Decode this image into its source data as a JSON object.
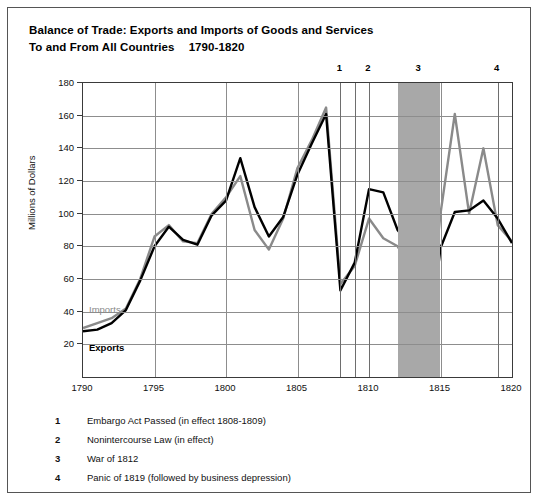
{
  "title": {
    "line1": "Balance of Trade: Exports and Imports of Goods and Services",
    "line2": "To and From All Countries",
    "line2_years": "1790-1820"
  },
  "series_labels": {
    "imports": "Imports",
    "exports": "Exports"
  },
  "colors": {
    "imports": "#8a8a8a",
    "exports": "#000000",
    "band": "#a8a8a8",
    "grid": "#8d8d8d",
    "axis": "#3a3a3a"
  },
  "markers": [
    {
      "id": "1",
      "label": "1",
      "year": 1808
    },
    {
      "id": "2",
      "label": "2",
      "year": 1810
    },
    {
      "id": "3",
      "label": "3",
      "year": 1813.5
    },
    {
      "id": "4",
      "label": "4",
      "year": 1819
    }
  ],
  "event_lines": [
    1808,
    1809,
    1810,
    1819
  ],
  "shaded_band": {
    "start": 1812,
    "end": 1815
  },
  "notes": [
    {
      "num": "1",
      "text": "Embargo Act Passed (in effect 1808-1809)"
    },
    {
      "num": "2",
      "text": "Nonintercourse Law (in effect)"
    },
    {
      "num": "3",
      "text": "War of 1812"
    },
    {
      "num": "4",
      "text": "Panic of 1819 (followed by business depression)"
    }
  ],
  "chart_data": {
    "type": "line",
    "xlabel": "",
    "ylabel": "Millions of Dollars",
    "xlim": [
      1790,
      1820
    ],
    "ylim": [
      0,
      180
    ],
    "yticks": [
      20,
      40,
      60,
      80,
      100,
      120,
      140,
      160,
      180
    ],
    "xticks": [
      1790,
      1795,
      1800,
      1805,
      1810,
      1815,
      1820
    ],
    "grid": true,
    "legend": "inline-labels",
    "x": [
      1790,
      1791,
      1792,
      1793,
      1794,
      1795,
      1796,
      1797,
      1798,
      1799,
      1800,
      1801,
      1802,
      1803,
      1804,
      1805,
      1806,
      1807,
      1808,
      1809,
      1810,
      1811,
      1812,
      1813,
      1814,
      1815,
      1816,
      1817,
      1818,
      1819,
      1820
    ],
    "series": [
      {
        "name": "Imports",
        "color": "#8a8a8a",
        "values": [
          30,
          33,
          36,
          42,
          60,
          86,
          93,
          83,
          82,
          100,
          110,
          123,
          90,
          78,
          97,
          128,
          145,
          165,
          57,
          68,
          97,
          85,
          80,
          66,
          13,
          100,
          161,
          100,
          140,
          93,
          83
        ]
      },
      {
        "name": "Exports",
        "color": "#000000",
        "values": [
          28,
          29,
          33,
          41,
          59,
          80,
          92,
          84,
          81,
          99,
          108,
          134,
          104,
          86,
          98,
          124,
          143,
          161,
          53,
          70,
          115,
          113,
          90,
          79,
          7,
          79,
          101,
          102,
          108,
          97,
          82
        ]
      }
    ],
    "annotations": [
      {
        "label": "1",
        "x": 1808,
        "text": "Embargo Act Passed (in effect 1808-1809)"
      },
      {
        "label": "2",
        "x": 1810,
        "text": "Nonintercourse Law (in effect)"
      },
      {
        "label": "3",
        "x": 1813.5,
        "text": "War of 1812"
      },
      {
        "label": "4",
        "x": 1819,
        "text": "Panic of 1819 (followed by business depression)"
      }
    ]
  }
}
